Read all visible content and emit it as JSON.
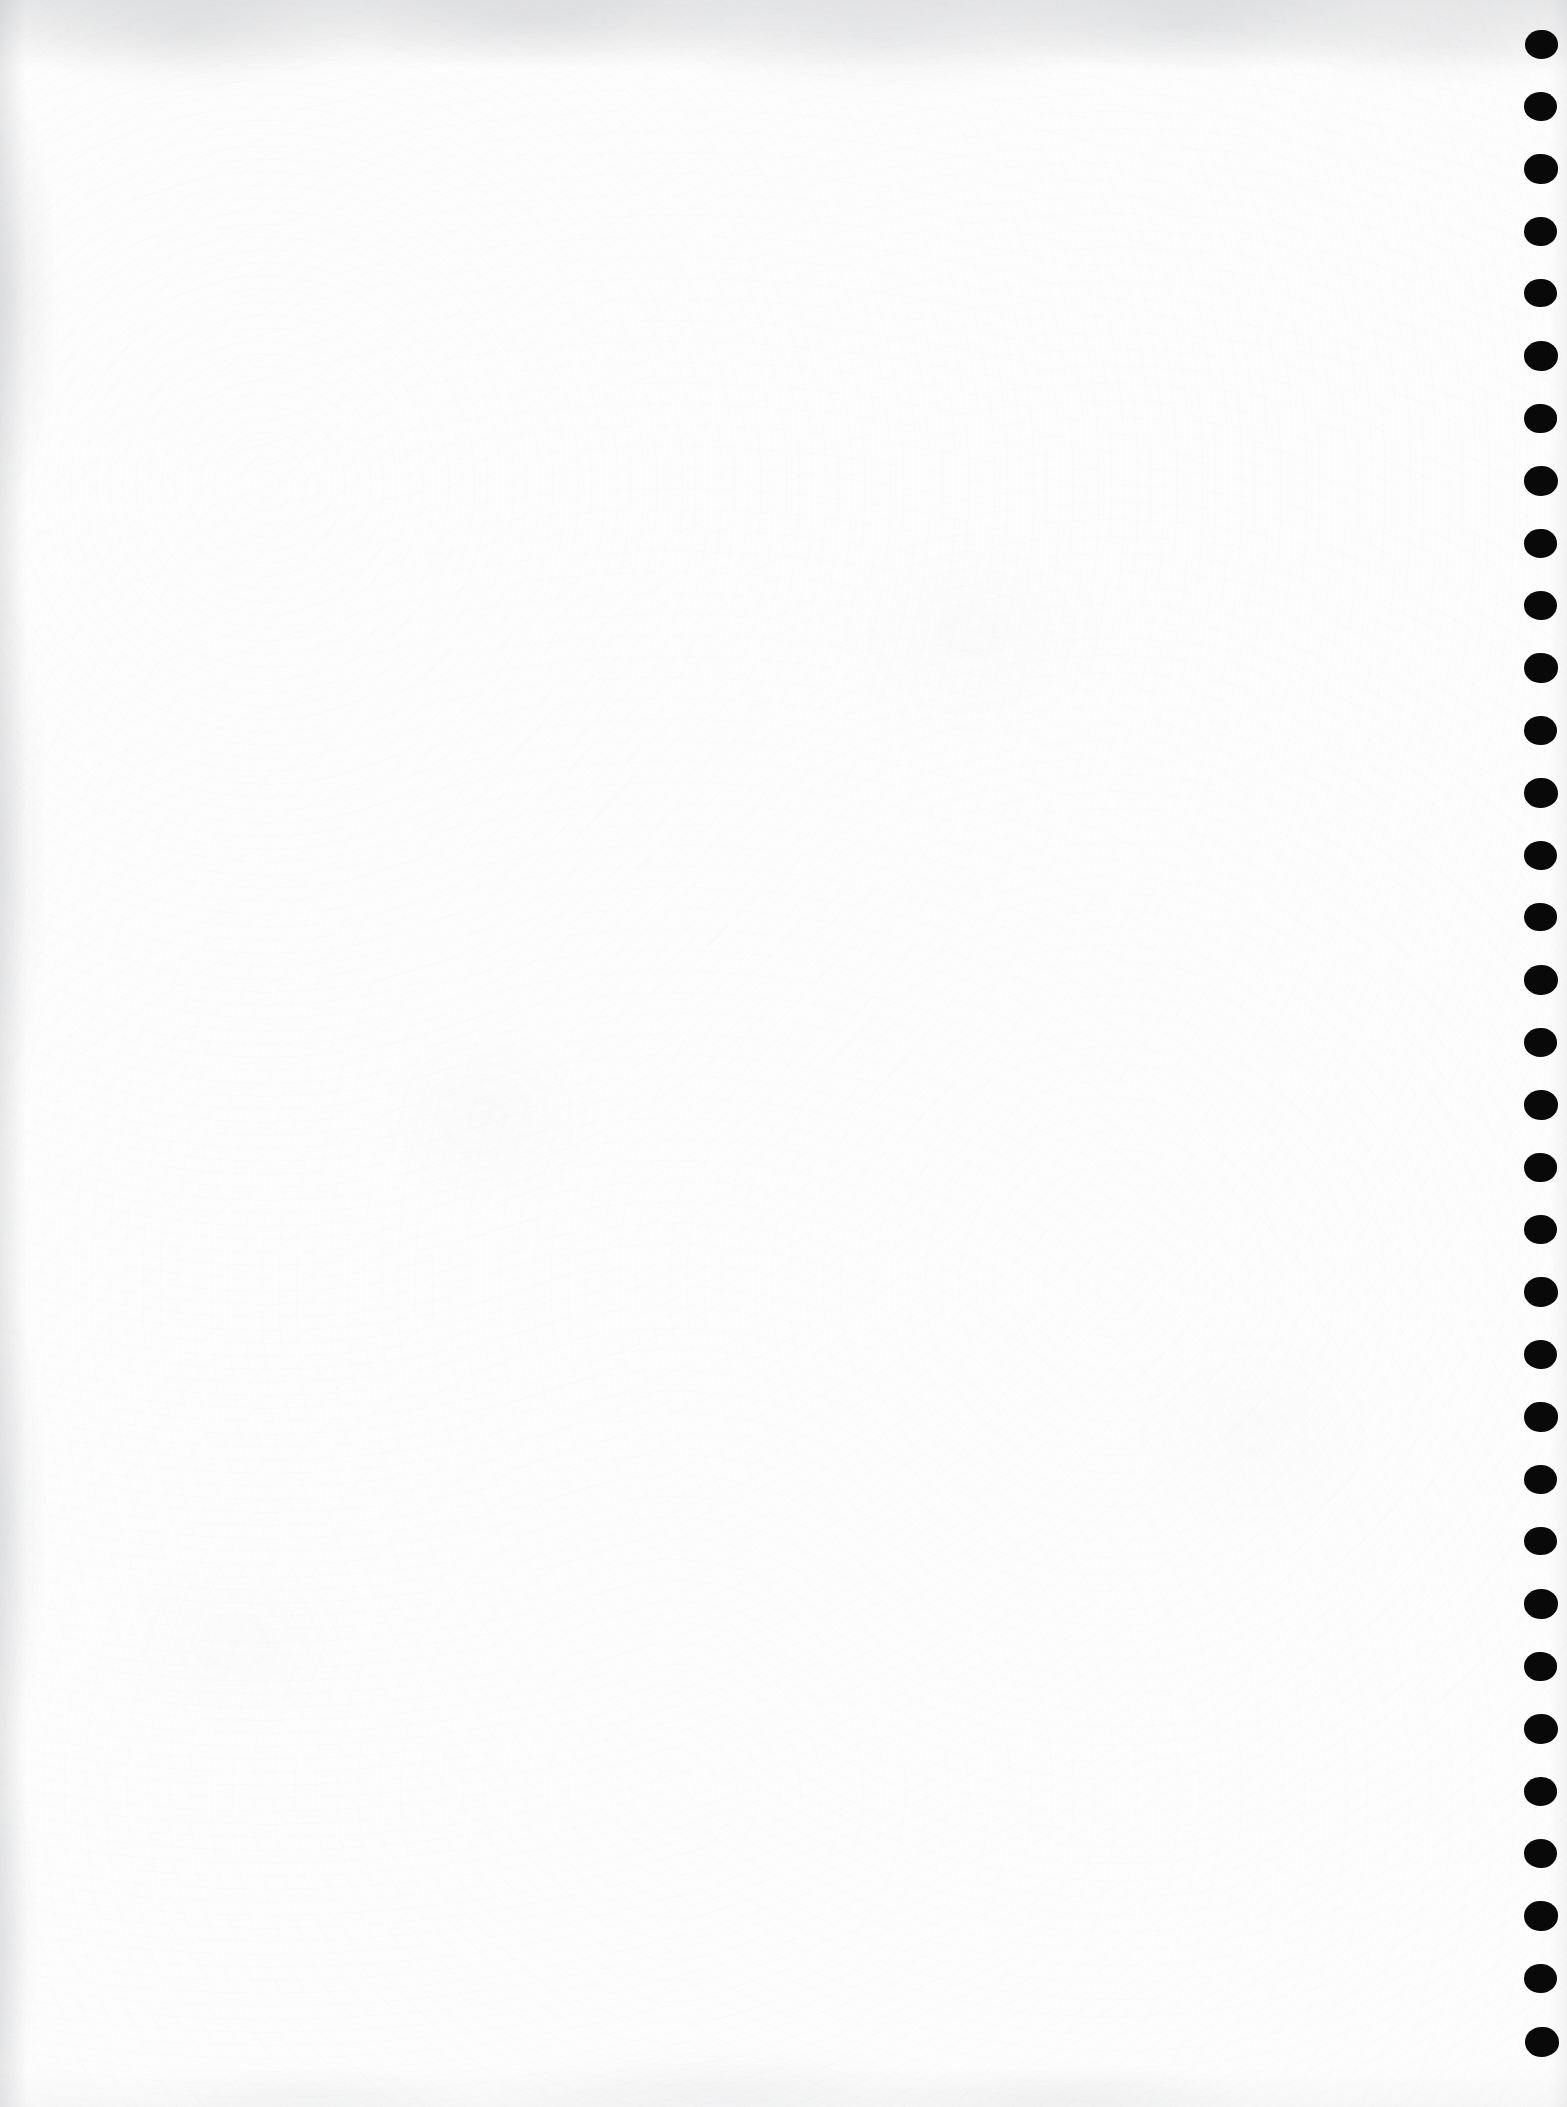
{
  "page": {
    "kind": "scanned-blank-page",
    "width": 1567,
    "height": 2107,
    "paper_color": "#fdfdfd",
    "ink_color": "#090909",
    "edge_shadow_color": "#9193985c",
    "body_text": "",
    "header_text": "",
    "footer_text": "",
    "page_number": ""
  },
  "punch_marks": {
    "name": "binding-hole-column",
    "count": 33,
    "color": "#090909",
    "center_x": 1540,
    "first_center_y": 44,
    "spacing_y": 62.4,
    "width": 34,
    "height": 30,
    "dots": [
      {
        "cx": 1541,
        "cy": 44,
        "w": 33,
        "h": 29
      },
      {
        "cx": 1540,
        "cy": 106,
        "w": 33,
        "h": 29
      },
      {
        "cx": 1541,
        "cy": 169,
        "w": 34,
        "h": 30
      },
      {
        "cx": 1540,
        "cy": 231,
        "w": 33,
        "h": 29
      },
      {
        "cx": 1540,
        "cy": 293,
        "w": 33,
        "h": 28
      },
      {
        "cx": 1541,
        "cy": 356,
        "w": 34,
        "h": 30
      },
      {
        "cx": 1540,
        "cy": 418,
        "w": 33,
        "h": 29
      },
      {
        "cx": 1541,
        "cy": 481,
        "w": 34,
        "h": 30
      },
      {
        "cx": 1540,
        "cy": 543,
        "w": 33,
        "h": 29
      },
      {
        "cx": 1540,
        "cy": 605,
        "w": 33,
        "h": 29
      },
      {
        "cx": 1541,
        "cy": 668,
        "w": 34,
        "h": 30
      },
      {
        "cx": 1540,
        "cy": 730,
        "w": 33,
        "h": 29
      },
      {
        "cx": 1541,
        "cy": 793,
        "w": 34,
        "h": 30
      },
      {
        "cx": 1540,
        "cy": 855,
        "w": 33,
        "h": 29
      },
      {
        "cx": 1540,
        "cy": 917,
        "w": 33,
        "h": 28
      },
      {
        "cx": 1541,
        "cy": 980,
        "w": 34,
        "h": 30
      },
      {
        "cx": 1540,
        "cy": 1042,
        "w": 33,
        "h": 29
      },
      {
        "cx": 1541,
        "cy": 1105,
        "w": 34,
        "h": 30
      },
      {
        "cx": 1540,
        "cy": 1167,
        "w": 33,
        "h": 29
      },
      {
        "cx": 1540,
        "cy": 1229,
        "w": 33,
        "h": 29
      },
      {
        "cx": 1541,
        "cy": 1292,
        "w": 34,
        "h": 30
      },
      {
        "cx": 1540,
        "cy": 1354,
        "w": 33,
        "h": 29
      },
      {
        "cx": 1541,
        "cy": 1417,
        "w": 34,
        "h": 30
      },
      {
        "cx": 1540,
        "cy": 1479,
        "w": 33,
        "h": 29
      },
      {
        "cx": 1540,
        "cy": 1541,
        "w": 33,
        "h": 28
      },
      {
        "cx": 1541,
        "cy": 1604,
        "w": 34,
        "h": 30
      },
      {
        "cx": 1540,
        "cy": 1666,
        "w": 33,
        "h": 29
      },
      {
        "cx": 1541,
        "cy": 1729,
        "w": 34,
        "h": 30
      },
      {
        "cx": 1540,
        "cy": 1791,
        "w": 33,
        "h": 29
      },
      {
        "cx": 1540,
        "cy": 1853,
        "w": 33,
        "h": 29
      },
      {
        "cx": 1541,
        "cy": 1916,
        "w": 34,
        "h": 30
      },
      {
        "cx": 1540,
        "cy": 1978,
        "w": 33,
        "h": 29
      },
      {
        "cx": 1542,
        "cy": 2042,
        "w": 34,
        "h": 30
      }
    ]
  }
}
